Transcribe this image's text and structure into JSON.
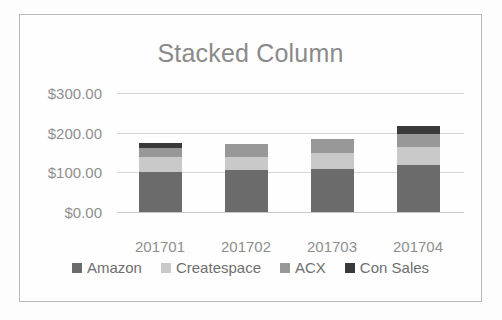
{
  "chart_data": {
    "type": "bar",
    "subtype": "stacked-column",
    "title": "Stacked Column",
    "xlabel": "",
    "ylabel": "",
    "categories": [
      "201701",
      "201702",
      "201703",
      "201704"
    ],
    "series": [
      {
        "name": "Amazon",
        "color": "#6b6b6b",
        "values": [
          101,
          106,
          108,
          118
        ]
      },
      {
        "name": "Createspace",
        "color": "#c9c9c9",
        "values": [
          38,
          33,
          40,
          45
        ]
      },
      {
        "name": "ACX",
        "color": "#989898",
        "values": [
          23,
          32,
          35,
          33
        ]
      },
      {
        "name": "Con Sales",
        "color": "#3a3a3a",
        "values": [
          12,
          0,
          0,
          21
        ]
      }
    ],
    "totals": [
      174,
      171,
      183,
      217
    ],
    "ylim": [
      0,
      300
    ],
    "y_ticks": [
      0,
      100,
      200,
      300
    ],
    "y_tick_labels": [
      "$0.00",
      "$100.00",
      "$200.00",
      "$300.00"
    ],
    "grid": true,
    "legend_position": "bottom",
    "currency_prefix": "$"
  },
  "legend": {
    "items": [
      {
        "label": "Amazon",
        "color": "#6b6b6b"
      },
      {
        "label": "Createspace",
        "color": "#c9c9c9"
      },
      {
        "label": "ACX",
        "color": "#989898"
      },
      {
        "label": "Con Sales",
        "color": "#3a3a3a"
      }
    ]
  },
  "colors": {
    "frame_border": "#b9b9b9",
    "gridline": "#d6d6d6",
    "axis_text": "#8f8f8f",
    "title_text": "#8a8a8a",
    "legend_text": "#6f6f6f",
    "background": "#fefefe"
  }
}
